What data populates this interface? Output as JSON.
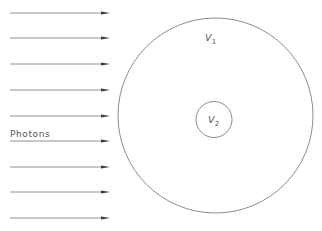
{
  "figure": {
    "name": "photon-irradiation-volume-diagram",
    "width": 322,
    "height": 231,
    "background_color": "#ffffff",
    "line_color": "#6e6e6e",
    "arrow_color": "#6b6b6b",
    "arrowhead_color": "#3c3c3c",
    "text_color": "#555555"
  },
  "labels": {
    "photons": "Photons",
    "outer_volume_symbol": "V",
    "outer_volume_subscript": "1",
    "inner_volume_symbol": "V",
    "inner_volume_subscript": "2"
  },
  "chart_data": {
    "type": "diagram",
    "title": "",
    "elements": {
      "arrows": {
        "count": 9,
        "x_start": 10,
        "x_end": 110,
        "y_positions": [
          13,
          38,
          64,
          90,
          116,
          141,
          167,
          192,
          218
        ],
        "direction": "right",
        "head_length": 9,
        "head_width": 3.2
      },
      "outer_circle": {
        "label": "V1",
        "center_x": 215.5,
        "center_y": 115.5,
        "radius": 97.5
      },
      "inner_circle": {
        "label": "V2",
        "center_x": 214,
        "center_y": 119.5,
        "radius": 18
      },
      "label_positions": {
        "photons": {
          "x": 10,
          "y": 137
        },
        "outer_volume": {
          "x": 205,
          "y": 41
        },
        "inner_volume": {
          "x": 208,
          "y": 123
        }
      }
    }
  }
}
